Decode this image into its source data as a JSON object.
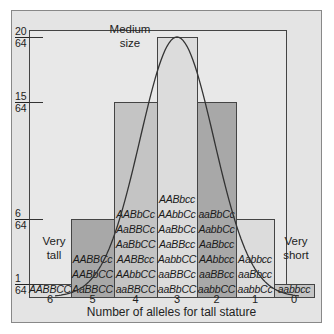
{
  "chart_data": {
    "type": "bar",
    "title": "",
    "xlabel": "Number of alleles for tall stature",
    "ylabel": "Frequency",
    "categories": [
      "6",
      "5",
      "4",
      "3",
      "2",
      "1",
      "0"
    ],
    "values": [
      1,
      6,
      15,
      20,
      15,
      6,
      1
    ],
    "value_labels": [
      "1/64",
      "6/64",
      "15/64",
      "20/64",
      "15/64",
      "6/64",
      "1/64"
    ],
    "y_ticks": [
      {
        "num": "20",
        "den": "64"
      },
      {
        "num": "15",
        "den": "64"
      },
      {
        "num": "6",
        "den": "64"
      },
      {
        "num": "1",
        "den": "64"
      }
    ],
    "ylim": [
      0,
      20
    ],
    "overlay": "normal curve",
    "genotypes": {
      "6": [
        "AABBCC"
      ],
      "5": [
        "AABBCc",
        "AABbCC",
        "AaBBCC"
      ],
      "4": [
        "AABbCc",
        "AaBBCc",
        "AaBbCC",
        "AABBcc",
        "AAbbCC",
        "aaBBCC"
      ],
      "3": [
        "AABbcc",
        "AAbbCc",
        "AaBbCc",
        "AaBBcc",
        "AabbCC",
        "aaBBCc",
        "aaBbCC"
      ],
      "2": [
        "aaBbCc",
        "AabbCc",
        "AaBbcc",
        "AAbbcc",
        "aaBBcc",
        "aabbCC"
      ],
      "1": [
        "Aabbcc",
        "aaBbcc",
        "aabbCc"
      ],
      "0": [
        "aabbcc"
      ]
    },
    "annotations": [
      "Very tall",
      "Medium size",
      "Very short"
    ],
    "grid": false,
    "legend": null
  },
  "labels": {
    "very_tall": [
      "Very",
      "tall"
    ],
    "medium": [
      "Medium",
      "size"
    ],
    "very_short": [
      "Very",
      "short"
    ],
    "x_axis": "Number of alleles for tall stature"
  },
  "colors": {
    "bar_light": "#dcdcdc",
    "bar_mid": "#c4c4c4",
    "bar_dark": "#a8a8a8",
    "background": "#e4e4e4",
    "curve": "#333333"
  }
}
